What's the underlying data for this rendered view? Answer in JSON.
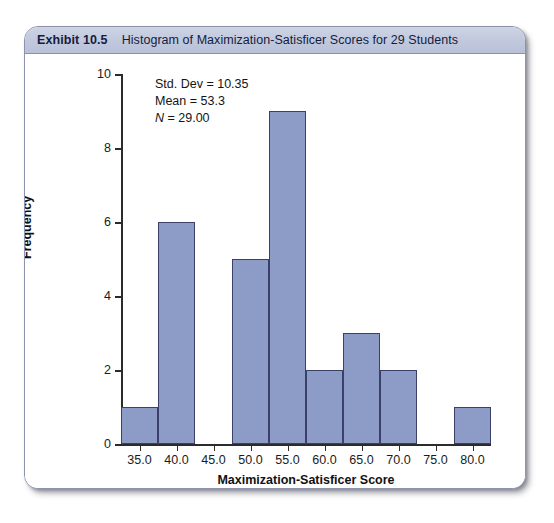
{
  "exhibit": {
    "number_label": "Exhibit 10.5",
    "title": "Histogram of Maximization-Satisficer Scores for 29 Students"
  },
  "stats": {
    "std_dev_line": "Std. Dev = 10.35",
    "mean_line": "Mean = 53.3",
    "n_symbol": "N",
    "n_value_line": " = 29.00"
  },
  "colors": {
    "bar_fill": "#8d9cc6",
    "bar_border": "#3b4068",
    "header_band": "#c3cade",
    "header_text": "#141c3e",
    "axis": "#2b2b2b"
  },
  "chart_data": {
    "type": "bar",
    "title": "Histogram of Maximization-Satisficer Scores for 29 Students",
    "xlabel": "Maximization-Satisficer Score",
    "ylabel": "Frequency",
    "categories": [
      "35.0",
      "40.0",
      "45.0",
      "50.0",
      "55.0",
      "60.0",
      "65.0",
      "70.0",
      "75.0",
      "80.0"
    ],
    "bin_centers": [
      35,
      40,
      45,
      50,
      55,
      60,
      65,
      70,
      75,
      80
    ],
    "bin_width": 5,
    "values": [
      1,
      6,
      0,
      5,
      9,
      2,
      3,
      2,
      0,
      1
    ],
    "xtick_labels": [
      "35.0",
      "40.0",
      "45.0",
      "50.0",
      "55.0",
      "60.0",
      "65.0",
      "70.0",
      "75.0",
      "80.0"
    ],
    "ytick_labels": [
      "0",
      "2",
      "4",
      "6",
      "8",
      "10"
    ],
    "ytick_values": [
      0,
      2,
      4,
      6,
      8,
      10
    ],
    "ylim": [
      0,
      10
    ],
    "xlim": [
      32.5,
      82.5
    ],
    "grid": false,
    "legend": "none",
    "annotations": [
      "Std. Dev = 10.35",
      "Mean = 53.3",
      "N = 29.00"
    ],
    "total_n": 29
  }
}
